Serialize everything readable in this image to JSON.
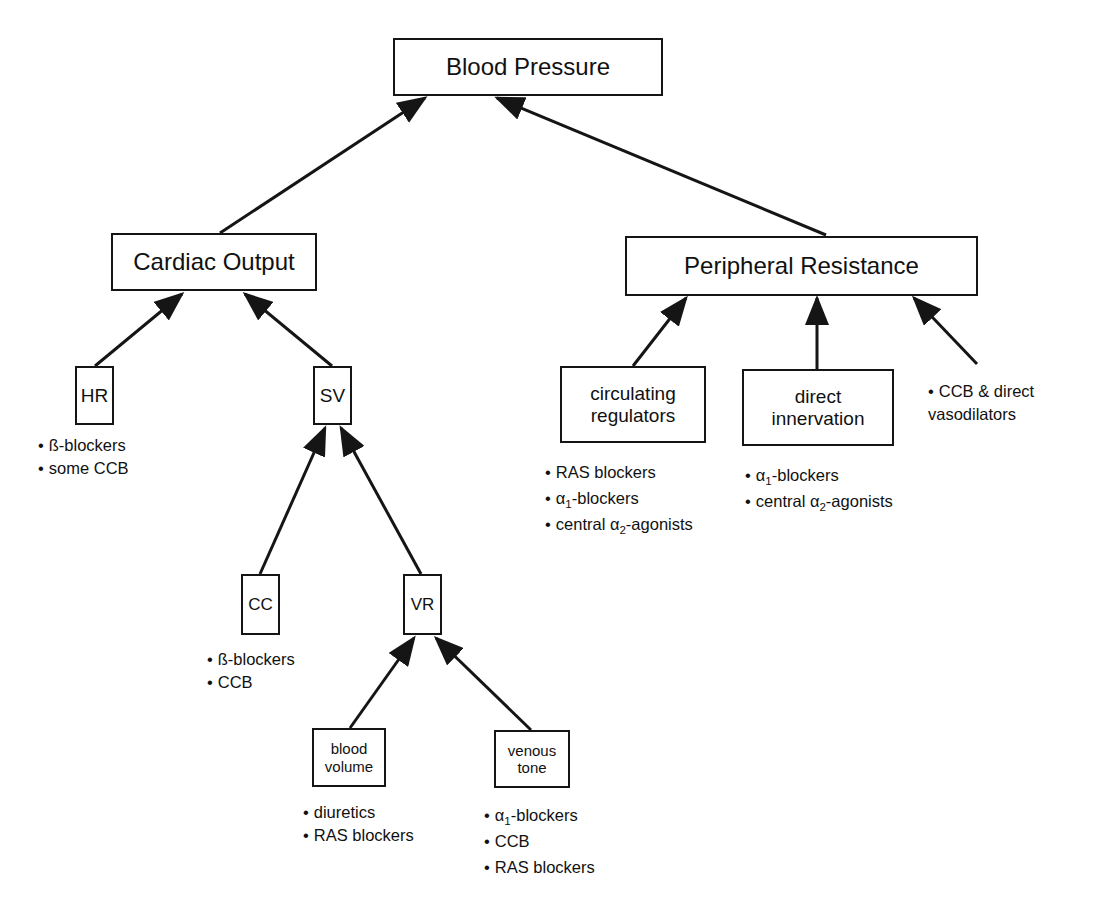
{
  "diagram": {
    "nodes": {
      "blood_pressure": "Blood Pressure",
      "cardiac_output": "Cardiac Output",
      "peripheral_resistance": "Peripheral Resistance",
      "hr": "HR",
      "sv": "SV",
      "circulating_regulators": "circulating\nregulators",
      "direct_innervation": "direct\ninnervation",
      "cc": "CC",
      "vr": "VR",
      "blood_volume": "blood\nvolume",
      "venous_tone": "venous\ntone"
    },
    "notes": {
      "hr": [
        "ß-blockers",
        "some CCB"
      ],
      "cc": [
        "ß-blockers",
        "CCB"
      ],
      "circulating_regulators": {
        "item1": "RAS blockers",
        "item2_prefix": "α",
        "item2_sub": "1",
        "item2_suffix": "-blockers",
        "item3_prefix": "central α",
        "item3_sub": "2",
        "item3_suffix": "-agonists"
      },
      "direct_innervation": {
        "item1_prefix": "α",
        "item1_sub": "1",
        "item1_suffix": "-blockers",
        "item2_prefix": "central α",
        "item2_sub": "2",
        "item2_suffix": "-agonists"
      },
      "vasodilators": [
        "CCB & direct",
        "vasodilators"
      ],
      "blood_volume": [
        "diuretics",
        "RAS blockers"
      ],
      "venous_tone": {
        "item1_prefix": "α",
        "item1_sub": "1",
        "item1_suffix": "-blockers",
        "item2": "CCB",
        "item3": "RAS blockers"
      }
    },
    "edges": [
      {
        "from": "cardiac_output",
        "to": "blood_pressure"
      },
      {
        "from": "peripheral_resistance",
        "to": "blood_pressure"
      },
      {
        "from": "hr",
        "to": "cardiac_output"
      },
      {
        "from": "sv",
        "to": "cardiac_output"
      },
      {
        "from": "cc",
        "to": "sv"
      },
      {
        "from": "vr",
        "to": "sv"
      },
      {
        "from": "blood_volume",
        "to": "vr"
      },
      {
        "from": "venous_tone",
        "to": "vr"
      },
      {
        "from": "circulating_regulators",
        "to": "peripheral_resistance"
      },
      {
        "from": "direct_innervation",
        "to": "peripheral_resistance"
      },
      {
        "from": "vasodilators_note",
        "to": "peripheral_resistance"
      }
    ],
    "colors": {
      "stroke": "#151515",
      "background": "#ffffff"
    }
  }
}
